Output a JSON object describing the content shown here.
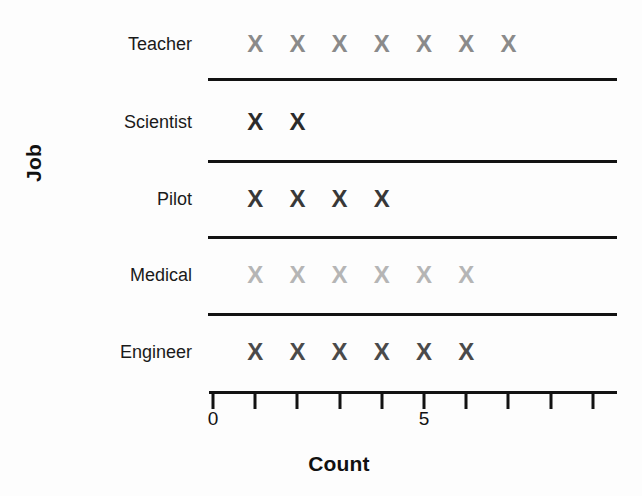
{
  "chart_data": {
    "type": "scatter",
    "plot_style": "pictograph-dot-plot",
    "title": "",
    "xlabel": "Count",
    "ylabel": "Job",
    "categories": [
      "Teacher",
      "Scientist",
      "Pilot",
      "Medical",
      "Engineer"
    ],
    "values": [
      7,
      2,
      4,
      6,
      6
    ],
    "marker_glyph": "X",
    "series": [
      {
        "name": "Teacher",
        "count": 7,
        "marker_color": "#8a8a8a",
        "x_positions": [
          1,
          2,
          3,
          4,
          5,
          6,
          7
        ]
      },
      {
        "name": "Scientist",
        "count": 2,
        "marker_color": "#2b2b2b",
        "x_positions": [
          1,
          2
        ]
      },
      {
        "name": "Pilot",
        "count": 4,
        "marker_color": "#383838",
        "x_positions": [
          1,
          2,
          3,
          4
        ]
      },
      {
        "name": "Medical",
        "count": 6,
        "marker_color": "#b5b5b5",
        "x_positions": [
          1,
          2,
          3,
          4,
          5,
          6
        ]
      },
      {
        "name": "Engineer",
        "count": 6,
        "marker_color": "#4a4a4a",
        "x_positions": [
          1,
          2,
          3,
          4,
          5,
          6
        ]
      }
    ],
    "xlim": [
      0,
      9
    ],
    "x_ticks": [
      0,
      1,
      2,
      3,
      4,
      5,
      6,
      7,
      8,
      9
    ],
    "x_tick_labels": [
      "0",
      "",
      "",
      "",
      "",
      "5",
      "",
      "",
      "",
      ""
    ],
    "grid": false,
    "legend": false,
    "category_separators": true
  },
  "layout": {
    "plot_left_px": 213,
    "plot_right_px": 617,
    "unit_px": 42.2,
    "axis_y_px": 392,
    "row_centers_px": [
      44,
      122,
      199,
      275,
      352
    ],
    "separators_y_px": [
      78,
      160,
      236,
      313
    ]
  }
}
